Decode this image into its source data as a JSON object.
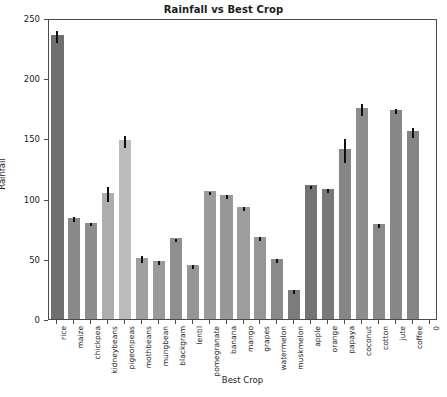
{
  "chart_data": {
    "type": "bar",
    "title": "Rainfall vs Best Crop",
    "xlabel": "Best Crop",
    "ylabel": "Rainfall",
    "ylim": [
      0,
      250
    ],
    "yticks": [
      0,
      50,
      100,
      150,
      200,
      250
    ],
    "grid": false,
    "legend": null,
    "categories": [
      "rice",
      "maize",
      "chickpea",
      "kidneybeans",
      "pigeonpeas",
      "mothbeans",
      "mungbean",
      "blackgram",
      "lentil",
      "pomegranate",
      "banana",
      "mango",
      "grapes",
      "watermelon",
      "muskmelon",
      "apple",
      "orange",
      "papaya",
      "coconut",
      "cotton",
      "jute",
      "coffee"
    ],
    "values": [
      236,
      84,
      80,
      105,
      149,
      51,
      48,
      67,
      45,
      106,
      103,
      93,
      68,
      50,
      24,
      111,
      108,
      141,
      175,
      79,
      174,
      156
    ],
    "errors": [
      5,
      2,
      1.5,
      6,
      5,
      3,
      1.5,
      1.5,
      1.5,
      1.5,
      2,
      1.5,
      1.5,
      1.5,
      1.5,
      1.5,
      1.5,
      10,
      5,
      1.5,
      2,
      4
    ],
    "bar_colors": [
      "#6f6f6f",
      "#898989",
      "#8d8d8d",
      "#adadad",
      "#bcbcbc",
      "#a0a0a0",
      "#9a9a9a",
      "#8f8f8f",
      "#959595",
      "#9b9b9b",
      "#979797",
      "#9d9d9d",
      "#969696",
      "#8a8a8a",
      "#7c7c7c",
      "#747474",
      "#787878",
      "#868686",
      "#8d8d8d",
      "#8b8b8b",
      "#878787",
      "#858585"
    ],
    "extra_xtick_label": "0"
  },
  "axes": {
    "frame_color": "#4b4b4b",
    "text_color": "#1b1b1b"
  }
}
